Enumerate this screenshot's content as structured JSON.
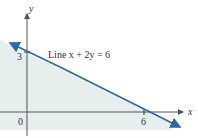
{
  "diagram": {
    "type": "linear-inequality-graph",
    "axes": {
      "x_label": "x",
      "y_label": "y",
      "origin_label": "0"
    },
    "ticks": {
      "x_intercept_label": "6",
      "y_intercept_label": "3"
    },
    "line": {
      "label": "Line x + 2y = 6",
      "equation": "x + 2y = 6",
      "x_intercept": 6,
      "y_intercept": 3,
      "color": "#2a6aa8"
    },
    "shaded_region": {
      "description": "half-plane below the line",
      "color": "#e6eeee"
    },
    "axis_color": "#555555"
  }
}
